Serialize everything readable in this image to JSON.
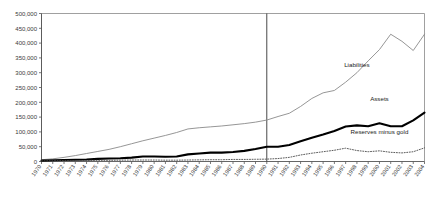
{
  "chart_data": {
    "type": "line",
    "title": "",
    "subtitle": "",
    "xlabel": "",
    "ylabel": "",
    "xlim": [
      1970,
      2004
    ],
    "ylim": [
      0,
      500000
    ],
    "grid": false,
    "legend_position": "inline-annotations",
    "y_ticks": [
      0,
      50000,
      100000,
      150000,
      200000,
      250000,
      300000,
      350000,
      400000,
      450000,
      500000
    ],
    "y_tick_labels": [
      "0",
      "50,000",
      "100,000",
      "150,000",
      "200,000",
      "250,000",
      "300,000",
      "350,000",
      "400,000",
      "450,000",
      "500,000"
    ],
    "x": [
      1970,
      1971,
      1972,
      1973,
      1974,
      1975,
      1976,
      1977,
      1978,
      1979,
      1980,
      1981,
      1982,
      1983,
      1984,
      1985,
      1986,
      1987,
      1988,
      1989,
      1990,
      1991,
      1992,
      1993,
      1994,
      1995,
      1996,
      1997,
      1998,
      1999,
      2000,
      2001,
      2002,
      2003,
      2004
    ],
    "x_tick_labels": [
      "1970",
      "1971",
      "1972",
      "1973",
      "1974",
      "1975",
      "1976",
      "1977",
      "1978",
      "1979",
      "1980",
      "1981",
      "1982",
      "1983",
      "1984",
      "1985",
      "1986",
      "1987",
      "1988",
      "1989",
      "1990",
      "1991",
      "1992",
      "1993",
      "1994",
      "1995",
      "1996",
      "1997",
      "1998",
      "1999",
      "2000",
      "2001",
      "2002",
      "2003",
      "2004"
    ],
    "annotations": [
      {
        "text": "Liabilities",
        "x": 1998,
        "y": 320000
      },
      {
        "text": "Assets",
        "x": 2000,
        "y": 205000
      },
      {
        "text": "Reserves minus gold",
        "x": 2000,
        "y": 92000
      }
    ],
    "marker_line": {
      "x": 1990,
      "label": ""
    },
    "series": [
      {
        "name": "Liabilities",
        "style": "thin-gray-line",
        "color": "#8a8a8a",
        "values": [
          6000,
          9000,
          14000,
          20000,
          27000,
          34000,
          41000,
          50000,
          60000,
          70000,
          79000,
          88000,
          98000,
          110000,
          114000,
          117000,
          120000,
          124000,
          128000,
          133000,
          140000,
          152000,
          163000,
          186000,
          213000,
          232000,
          240000,
          268000,
          300000,
          340000,
          378000,
          430000,
          406000,
          375000,
          430000
        ]
      },
      {
        "name": "Assets",
        "style": "thick-black-line",
        "color": "#000000",
        "values": [
          3000,
          4000,
          5000,
          6000,
          7000,
          9000,
          10000,
          11000,
          13000,
          17000,
          17000,
          16000,
          17000,
          24000,
          27000,
          30000,
          30000,
          32000,
          36000,
          42000,
          50000,
          50000,
          56000,
          68000,
          80000,
          91000,
          103000,
          118000,
          122000,
          119000,
          129000,
          119000,
          119000,
          139000,
          165000
        ]
      },
      {
        "name": "Reserves minus gold",
        "style": "dotted-line",
        "color": "#4a4a4a",
        "values": [
          2000,
          2500,
          3000,
          3000,
          3500,
          4000,
          4000,
          4500,
          5000,
          5000,
          5000,
          4500,
          4500,
          5000,
          5500,
          6000,
          6000,
          7000,
          7000,
          7500,
          8000,
          10000,
          14000,
          22000,
          28000,
          33000,
          38000,
          45000,
          37000,
          33000,
          36000,
          31000,
          29000,
          33000,
          46000
        ]
      }
    ]
  }
}
